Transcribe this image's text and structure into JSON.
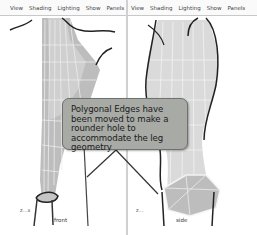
{
  "viewports": {
    "left": {
      "menu": [
        "View",
        "Shading",
        "Lighting",
        "Show",
        "Panels"
      ],
      "axis_label": "z…x",
      "view_label": "front"
    },
    "right": {
      "menu": [
        "View",
        "Shading",
        "Lighting",
        "Show",
        "Panels"
      ],
      "axis_label": "z…",
      "view_label": "side"
    }
  },
  "callout": {
    "text": "Polygonal Edges have been moved to make a rounder hole to accommodate the leg geometry"
  },
  "colors": {
    "mesh_fill": "#bdbdbd",
    "mesh_light": "#dcdcdc",
    "callout_bg": "#a8aaa6",
    "outline": "#2a2a2a"
  }
}
